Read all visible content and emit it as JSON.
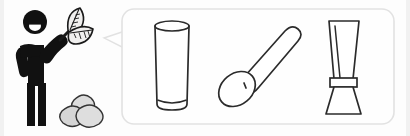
{
  "scene": {
    "width": 410,
    "height": 136,
    "background_color": "#fdfdfd",
    "edge_band_color": "#f1f1f1",
    "title": "Person with tea leaves imagining matcha tools"
  },
  "figure": {
    "name": "stick-figure-person",
    "color": "#111111",
    "smile_color": "#ffffff",
    "head": {
      "cx": 35,
      "cy": 22,
      "r": 12
    },
    "smile": {
      "cx": 35,
      "cy": 26,
      "rx": 6,
      "ry": 5
    }
  },
  "leaves": {
    "name": "tea-leaves",
    "description": "Two veined tea leaves held up in the figure's hand",
    "fill_color": "#f0efee",
    "stroke_color": "#1a1a1a",
    "count": 2
  },
  "stones": {
    "name": "stones-cluster",
    "description": "Three rounded gray stones / roasted nuts on the ground",
    "fill_color": "#d9d9d9",
    "stroke_color": "#333333",
    "count": 3
  },
  "bubble": {
    "name": "thought-bubble",
    "description": "Rounded rectangle thought bubble with a pointed tail aimed at the figure",
    "fill_color": "#fefefe",
    "border_color": "#e2e2e2",
    "x": 122,
    "y": 9,
    "width": 272,
    "height": 115,
    "radius": 12
  },
  "bubble_items": [
    {
      "name": "glass-cup",
      "label": "Tall glass",
      "icon": "glass-icon",
      "fill_color": "#ffffff",
      "stroke_color": "#2b2b2b"
    },
    {
      "name": "spoon",
      "label": "Spoon",
      "icon": "spoon-icon",
      "fill_color": "#ffffff",
      "stroke_color": "#2b2b2b"
    },
    {
      "name": "bamboo-whisk",
      "label": "Bamboo whisk",
      "icon": "whisk-icon",
      "fill_color": "#ffffff",
      "stroke_color": "#2b2b2b"
    }
  ]
}
